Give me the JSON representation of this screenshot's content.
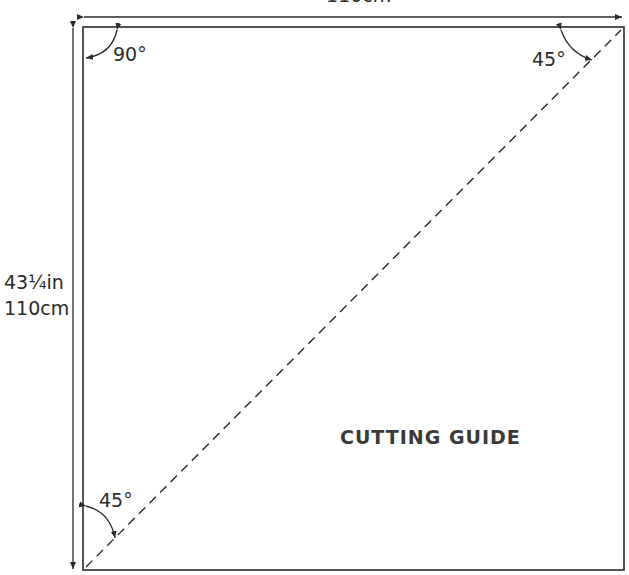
{
  "diagram": {
    "title": "CUTTING GUIDE",
    "dimensions": {
      "width_label": "110cm",
      "height_in": "43¼in",
      "height_cm": "110cm"
    },
    "angles": {
      "top_left": "90°",
      "top_right": "45°",
      "bottom_left": "45°"
    },
    "colors": {
      "line": "#2b2b2b",
      "background": "#ffffff"
    }
  }
}
